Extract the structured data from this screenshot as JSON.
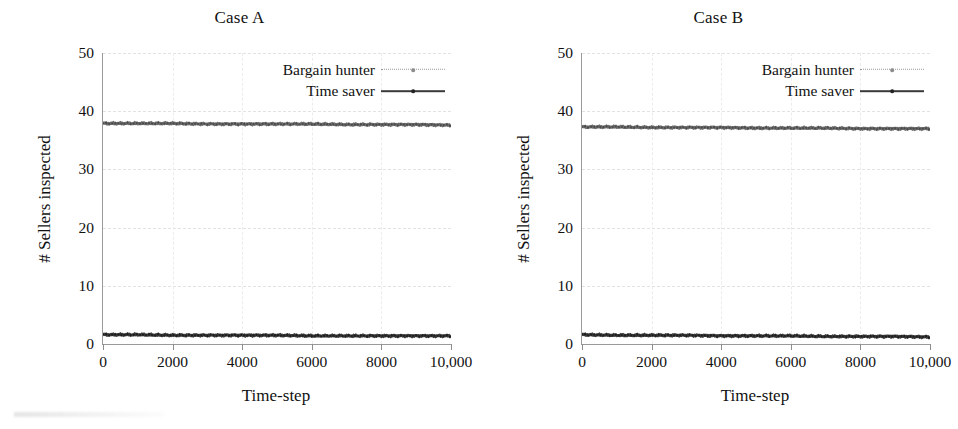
{
  "figure": {
    "background": "#ffffff",
    "panel_count": 2
  },
  "chart_data": [
    {
      "type": "line",
      "title": "Case A",
      "xlabel": "Time-step",
      "ylabel": "# Sellers inspected",
      "xlim": [
        0,
        10000
      ],
      "ylim": [
        0,
        50
      ],
      "xticks": [
        0,
        2000,
        4000,
        6000,
        8000,
        10000
      ],
      "xticklabels": [
        "0",
        "2000",
        "4000",
        "6000",
        "8000",
        "10,000"
      ],
      "yticks": [
        0,
        10,
        20,
        30,
        40,
        50
      ],
      "yticklabels": [
        "0",
        "10",
        "20",
        "30",
        "40",
        "50"
      ],
      "grid": true,
      "legend_position": "upper right",
      "series": [
        {
          "name": "Bargain hunter",
          "color": "#3a3a3a",
          "style": "dotted-with-markers",
          "x": [
            0,
            1000,
            2000,
            3000,
            4000,
            5000,
            6000,
            7000,
            8000,
            9000,
            10000
          ],
          "values": [
            1.6,
            1.6,
            1.5,
            1.5,
            1.5,
            1.5,
            1.4,
            1.4,
            1.4,
            1.4,
            1.4
          ]
        },
        {
          "name": "Time saver",
          "color": "#6d6d6d",
          "style": "solid-with-markers",
          "x": [
            0,
            1000,
            2000,
            3000,
            4000,
            5000,
            6000,
            7000,
            8000,
            9000,
            10000
          ],
          "values": [
            37.9,
            37.9,
            37.9,
            37.8,
            37.8,
            37.8,
            37.8,
            37.7,
            37.7,
            37.7,
            37.6
          ]
        }
      ]
    },
    {
      "type": "line",
      "title": "Case B",
      "xlabel": "Time-step",
      "ylabel": "# Sellers inspected",
      "xlim": [
        0,
        10000
      ],
      "ylim": [
        0,
        50
      ],
      "xticks": [
        0,
        2000,
        4000,
        6000,
        8000,
        10000
      ],
      "xticklabels": [
        "0",
        "2000",
        "4000",
        "6000",
        "8000",
        "10,000"
      ],
      "yticks": [
        0,
        10,
        20,
        30,
        40,
        50
      ],
      "yticklabels": [
        "0",
        "10",
        "20",
        "30",
        "40",
        "50"
      ],
      "grid": true,
      "legend_position": "upper right",
      "series": [
        {
          "name": "Bargain hunter",
          "color": "#3a3a3a",
          "style": "dotted-with-markers",
          "x": [
            0,
            1000,
            2000,
            3000,
            4000,
            5000,
            6000,
            7000,
            8000,
            9000,
            10000
          ],
          "values": [
            1.6,
            1.5,
            1.5,
            1.5,
            1.4,
            1.4,
            1.4,
            1.3,
            1.3,
            1.3,
            1.2
          ]
        },
        {
          "name": "Time saver",
          "color": "#6d6d6d",
          "style": "solid-with-markers",
          "x": [
            0,
            1000,
            2000,
            3000,
            4000,
            5000,
            6000,
            7000,
            8000,
            9000,
            10000
          ],
          "values": [
            37.3,
            37.3,
            37.2,
            37.2,
            37.2,
            37.1,
            37.1,
            37.1,
            37.0,
            37.0,
            37.0
          ]
        }
      ]
    }
  ]
}
